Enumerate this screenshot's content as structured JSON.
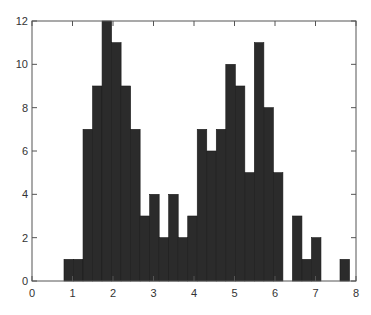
{
  "chart_data": {
    "type": "bar",
    "subtype": "histogram",
    "title": "",
    "xlabel": "",
    "ylabel": "",
    "xlim": [
      0,
      8
    ],
    "ylim": [
      0,
      12
    ],
    "xticks": [
      0,
      1,
      2,
      3,
      4,
      5,
      6,
      7,
      8
    ],
    "yticks": [
      0,
      2,
      4,
      6,
      8,
      10,
      12
    ],
    "grid": false,
    "legend": null,
    "bin_start": 0.79,
    "bin_width": 0.235,
    "bin_centers": [
      0.91,
      1.14,
      1.38,
      1.61,
      1.85,
      2.08,
      2.32,
      2.55,
      2.79,
      3.02,
      3.26,
      3.49,
      3.73,
      3.96,
      4.2,
      4.43,
      4.67,
      4.9,
      5.14,
      5.37,
      5.61,
      5.84,
      6.08,
      6.31,
      6.55,
      6.78,
      7.02,
      7.25,
      7.49,
      7.72
    ],
    "values": [
      1,
      1,
      7,
      9,
      12,
      11,
      9,
      7,
      3,
      4,
      2,
      4,
      2,
      3,
      7,
      6,
      7,
      10,
      9,
      5,
      11,
      8,
      5,
      0,
      3,
      1,
      2,
      0,
      0,
      1
    ],
    "bar_color": "#2b2b2b",
    "bar_edge_color": "#1a1a1a"
  },
  "plot": {
    "width": 371,
    "height": 315,
    "margin": {
      "left": 32,
      "right": 15,
      "top": 21,
      "bottom": 34
    }
  }
}
